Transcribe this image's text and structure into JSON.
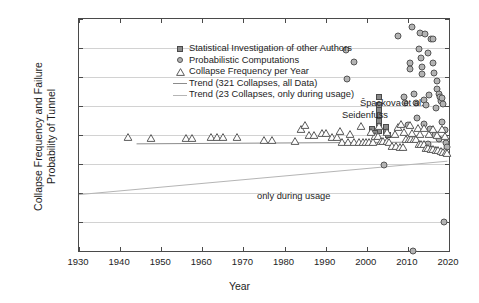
{
  "chart_data": {
    "type": "scatter",
    "title": "",
    "xlabel": "Year",
    "ylabel": "Collapse Frequency and Failure Probability of Tunnel",
    "ylabel_line1": "Collapse Frequency and Failure",
    "ylabel_line2": "Probability of Tunnel",
    "xlim": [
      1930,
      2020
    ],
    "ylim": [
      1e-08,
      1
    ],
    "yscale": "log",
    "grid": "horizontal",
    "legend_position": "top-left-inside",
    "xticks": [
      1930,
      1940,
      1950,
      1960,
      1970,
      1980,
      1990,
      2000,
      2010,
      2020
    ],
    "xticklabels": [
      "1930",
      "1940",
      "1950",
      "1960",
      "1970",
      "1980",
      "1990",
      "2000",
      "2010",
      "2020"
    ],
    "yticks": [
      1,
      0.1,
      0.01,
      0.001,
      0.0001,
      1e-05,
      1e-06,
      1e-07,
      1e-08
    ],
    "yticklabels": [
      "10⁰",
      "10⁻¹",
      "10⁻²",
      "10⁻³",
      "10⁻⁴",
      "10⁻⁵",
      "10⁻⁶",
      "10⁻⁷",
      "10⁻⁸"
    ],
    "ytick_exponents": [
      "0",
      "-1",
      "-2",
      "-3",
      "-4",
      "-5",
      "-6",
      "-7",
      "-8"
    ],
    "annotations": [
      {
        "text": "Špackova et al.",
        "x": 1999.5,
        "y": 0.0018
      },
      {
        "text": "Seidenfuss",
        "x": 1995.0,
        "y": 0.00075
      },
      {
        "text": "only during usage",
        "x": 1960.5,
        "y": 2e-07
      }
    ],
    "series": [
      {
        "name": "Statistical Investigation of other Authors",
        "marker": "square",
        "color": "#8a8a8a",
        "points": [
          [
            2003.0,
            0.0021
          ],
          [
            2003.0,
            0.0011
          ],
          [
            2003.0,
            0.00072
          ],
          [
            2003.0,
            0.00048
          ],
          [
            2003.0,
            0.00031
          ],
          [
            2003.0,
            0.00021
          ],
          [
            2003.0,
            0.00014
          ],
          [
            2004.6,
            0.00019
          ],
          [
            2004.6,
            0.00013
          ],
          [
            2005.2,
            9.8e-05
          ],
          [
            2001.2,
            0.00016
          ],
          [
            2002.0,
            0.00012
          ]
        ]
      },
      {
        "name": "Probabilistic Computations",
        "marker": "circle",
        "color": "#b3b3b3",
        "points": [
          [
            1995.0,
            0.085
          ],
          [
            1995.2,
            0.0082
          ],
          [
            1997.0,
            0.032
          ],
          [
            2007.5,
            0.26
          ],
          [
            2011.0,
            0.52
          ],
          [
            2013.0,
            0.33
          ],
          [
            2014.2,
            0.3
          ],
          [
            2015.6,
            0.21
          ],
          [
            2016.0,
            0.2
          ],
          [
            2012.8,
            0.092
          ],
          [
            2010.5,
            0.03
          ],
          [
            2010.6,
            0.019
          ],
          [
            2013.2,
            0.047
          ],
          [
            2013.4,
            0.022
          ],
          [
            2013.5,
            0.013
          ],
          [
            2015.0,
            0.065
          ],
          [
            2016.2,
            0.031
          ],
          [
            2016.4,
            0.014
          ],
          [
            2017.0,
            0.0072
          ],
          [
            2017.2,
            0.004
          ],
          [
            2017.5,
            0.0026
          ],
          [
            2017.8,
            0.0021
          ],
          [
            2018.0,
            0.0015
          ],
          [
            2018.2,
            0.0019
          ],
          [
            2018.6,
            0.0012
          ],
          [
            2009.0,
            0.0021
          ],
          [
            2009.2,
            0.0013
          ],
          [
            2011.5,
            0.0026
          ],
          [
            2012.0,
            0.0013
          ],
          [
            2014.0,
            0.0016
          ],
          [
            2014.5,
            0.0011
          ],
          [
            2015.2,
            0.0024
          ],
          [
            2016.8,
            0.00085
          ],
          [
            2012.2,
            0.00038
          ],
          [
            2013.8,
            0.00024
          ],
          [
            2015.4,
            0.00016
          ],
          [
            2016.5,
            0.0001
          ],
          [
            2017.6,
            7.2e-05
          ],
          [
            2018.4,
            0.00028
          ],
          [
            2019.0,
            0.00015
          ],
          [
            2019.2,
            5.5e-05
          ],
          [
            2004.2,
            9.5e-06
          ],
          [
            2011.2,
            1e-08
          ],
          [
            2018.8,
            1e-07
          ],
          [
            2019.4,
            3.8e-05
          ],
          [
            2010.0,
            0.00022
          ],
          [
            2014.8,
            4.8e-05
          ],
          [
            2016.6,
            3e-05
          ]
        ]
      },
      {
        "name": "Collapse Frequency per Year",
        "marker": "triangle",
        "color": "#5a5a5a",
        "points": [
          [
            1942.0,
            8.2e-05
          ],
          [
            1947.5,
            8e-05
          ],
          [
            1956.0,
            8e-05
          ],
          [
            1957.5,
            8e-05
          ],
          [
            1962.0,
            8.4e-05
          ],
          [
            1963.5,
            8.4e-05
          ],
          [
            1965.0,
            8.4e-05
          ],
          [
            1968.5,
            8.2e-05
          ],
          [
            1975.0,
            6.6e-05
          ],
          [
            1977.0,
            6.6e-05
          ],
          [
            1982.5,
            6.2e-05
          ],
          [
            1984.0,
            0.00016
          ],
          [
            1986.0,
            9.8e-05
          ],
          [
            1987.2,
            9.8e-05
          ],
          [
            1991.5,
            8.6e-05
          ],
          [
            1992.8,
            8.6e-05
          ],
          [
            1994.0,
            5.8e-05
          ],
          [
            1995.5,
            5.8e-05
          ],
          [
            1997.0,
            5.9e-05
          ],
          [
            1998.0,
            5.9e-05
          ],
          [
            1999.0,
            5.8e-05
          ],
          [
            1999.8,
            5.8e-05
          ],
          [
            2000.6,
            5.8e-05
          ],
          [
            2001.4,
            5.8e-05
          ],
          [
            2002.0,
            9.5e-05
          ],
          [
            2002.8,
            9.5e-05
          ],
          [
            2003.4,
            6e-05
          ],
          [
            2004.0,
            6e-05
          ],
          [
            2004.8,
            6e-05
          ],
          [
            2005.5,
            5.8e-05
          ],
          [
            2006.2,
            4.2e-05
          ],
          [
            2007.0,
            4.2e-05
          ],
          [
            2008.0,
            4e-05
          ],
          [
            2008.8,
            4e-05
          ],
          [
            2009.6,
            7e-05
          ],
          [
            2010.2,
            7e-05
          ],
          [
            2010.8,
            7.4e-05
          ],
          [
            2011.4,
            7.4e-05
          ],
          [
            2012.0,
            7.2e-05
          ],
          [
            2012.6,
            5e-05
          ],
          [
            2013.2,
            5e-05
          ],
          [
            2013.8,
            5e-05
          ],
          [
            2014.4,
            3.6e-05
          ],
          [
            2015.0,
            3.6e-05
          ],
          [
            2015.6,
            3.4e-05
          ],
          [
            2016.2,
            3.4e-05
          ],
          [
            2016.8,
            3e-05
          ],
          [
            2017.4,
            3e-05
          ],
          [
            2018.0,
            2.8e-05
          ],
          [
            2018.6,
            2.6e-05
          ],
          [
            2019.2,
            2.6e-05
          ],
          [
            2019.6,
            2.4e-05
          ],
          [
            1989.0,
            0.00012
          ],
          [
            1990.0,
            0.00012
          ],
          [
            1993.5,
            0.00014
          ],
          [
            1996.0,
            0.00011
          ],
          [
            2001.0,
            0.00013
          ],
          [
            2005.0,
            0.00013
          ],
          [
            2006.8,
            0.00011
          ],
          [
            2009.0,
            0.00013
          ],
          [
            2011.0,
            0.00012
          ],
          [
            2013.0,
            0.00011
          ],
          [
            2015.2,
            0.000105
          ],
          [
            2017.0,
            9.8e-05
          ],
          [
            2019.0,
            9.2e-05
          ],
          [
            2003.0,
            0.0002
          ],
          [
            2007.5,
            0.00019
          ],
          [
            2012.4,
            0.00018
          ],
          [
            2014.0,
            0.00017
          ],
          [
            2016.0,
            0.00016
          ],
          [
            2018.4,
            0.00016
          ],
          [
            1985.0,
            0.00022
          ],
          [
            1998.5,
            0.00021
          ],
          [
            2008.4,
            0.00024
          ],
          [
            2010.6,
            0.00023
          ]
        ]
      }
    ],
    "trend_lines": [
      {
        "name": "Trend (321 Collapses, all Data)",
        "color": "#8c8c8c",
        "x0": 1944.0,
        "y0": 4.95e-05,
        "x1": 2019.6,
        "y1": 5.75e-05
      },
      {
        "name": "Trend (23 Collapses, only during usage)",
        "color": "#b5b5b5",
        "x0": 1930.0,
        "y0": 8.8e-07,
        "x1": 2019.6,
        "y1": 1.25e-05
      }
    ]
  },
  "legend": {
    "items": [
      {
        "label": "Statistical Investigation of other Authors",
        "symbol": "square"
      },
      {
        "label": "Probabilistic Computations",
        "symbol": "circle"
      },
      {
        "label": "Collapse Frequency per Year",
        "symbol": "triangle"
      },
      {
        "label": "Trend (321 Collapses, all Data)",
        "symbol": "line"
      },
      {
        "label": "Trend (23 Collapses, only during usage)",
        "symbol": "line2"
      }
    ]
  }
}
